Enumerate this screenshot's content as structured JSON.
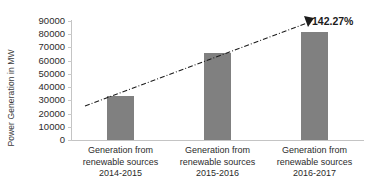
{
  "chart_data": {
    "type": "bar",
    "title": "",
    "xlabel": "",
    "ylabel": "Power Generation in MW",
    "categories": [
      "Generation from renewable sources 2014-2015",
      "Generation from renewable sources 2015-2016",
      "Generation from renewable sources 2016-2017"
    ],
    "category_lines": [
      [
        "Generation from",
        "renewable sources",
        "2014-2015"
      ],
      [
        "Generation from",
        "renewable sources",
        "2015-2016"
      ],
      [
        "Generation from",
        "renewable sources",
        "2016-2017"
      ]
    ],
    "values": [
      33000,
      66000,
      82000
    ],
    "ylim": [
      0,
      90000
    ],
    "ytick_values": [
      0,
      10000,
      20000,
      30000,
      40000,
      50000,
      60000,
      70000,
      80000,
      90000
    ],
    "ytick_labels": [
      "0",
      "10000",
      "20000",
      "30000",
      "40000",
      "50000",
      "60000",
      "70000",
      "80000",
      "90000"
    ],
    "grid": false,
    "legend": false,
    "bar_color": "#808080",
    "annotations": [
      {
        "name": "growth-percentage",
        "text": "142.27%",
        "type": "trendline-arrow-label"
      }
    ],
    "trendline": {
      "name": "growth-trendline",
      "style": "dash-dot",
      "color": "#1c1c1c",
      "arrow": true,
      "start": {
        "x": 85,
        "y": 106
      },
      "end": {
        "x": 311,
        "y": 22
      }
    }
  },
  "axis": {
    "y_title": "Power Generation in MW"
  }
}
